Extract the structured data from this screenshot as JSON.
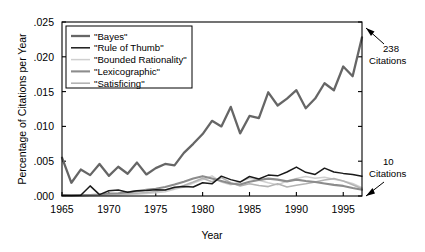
{
  "chart_data": {
    "type": "line",
    "title": "",
    "xlabel": "Year",
    "ylabel": "Percentage of Citations per Year",
    "xlim": [
      1965,
      1997
    ],
    "ylim": [
      0.0,
      0.025
    ],
    "grid": false,
    "legend_position": "top-left-inside",
    "xticks": [
      1965,
      1970,
      1975,
      1980,
      1985,
      1990,
      1995
    ],
    "xtick_labels": [
      "1965",
      "1970",
      "1975",
      "1980",
      "1985",
      "1990",
      "1995"
    ],
    "yticks": [
      0.0,
      0.005,
      0.01,
      0.015,
      0.02,
      0.025
    ],
    "ytick_labels": [
      ".000",
      ".005",
      ".010",
      ".015",
      ".020",
      ".025"
    ],
    "x": [
      1965,
      1966,
      1967,
      1968,
      1969,
      1970,
      1971,
      1972,
      1973,
      1974,
      1975,
      1976,
      1977,
      1978,
      1979,
      1980,
      1981,
      1982,
      1983,
      1984,
      1985,
      1986,
      1987,
      1988,
      1989,
      1990,
      1991,
      1992,
      1993,
      1994,
      1995,
      1996,
      1997
    ],
    "series": [
      {
        "name": "\"Bayes\"",
        "color": "#666666",
        "width": 2.3,
        "values": [
          0.0055,
          0.0019,
          0.0038,
          0.003,
          0.0046,
          0.0029,
          0.0042,
          0.0032,
          0.0048,
          0.0031,
          0.004,
          0.0046,
          0.0044,
          0.0062,
          0.0075,
          0.0089,
          0.0108,
          0.01,
          0.0128,
          0.009,
          0.0115,
          0.0112,
          0.0149,
          0.013,
          0.014,
          0.0152,
          0.0126,
          0.014,
          0.0162,
          0.0152,
          0.0186,
          0.0172,
          0.0228
        ]
      },
      {
        "name": "\"Rule of Thumb\"",
        "color": "#1a1a1a",
        "width": 1.5,
        "values": [
          0.0001,
          8e-05,
          0.00012,
          0.00145,
          0.0002,
          0.00075,
          0.00085,
          0.00055,
          0.00075,
          0.0008,
          0.0009,
          0.00085,
          0.00125,
          0.00135,
          0.0013,
          0.0019,
          0.00175,
          0.00285,
          0.00235,
          0.002,
          0.0028,
          0.00245,
          0.003,
          0.0029,
          0.00345,
          0.00415,
          0.0034,
          0.0031,
          0.004,
          0.00345,
          0.00325,
          0.0031,
          0.00285
        ]
      },
      {
        "name": "\"Bounded Rationality\"",
        "color": "#cfcfcf",
        "width": 1.5,
        "values": [
          5e-05,
          5e-05,
          5e-05,
          8e-05,
          0.0001,
          0.00015,
          0.00012,
          0.0002,
          0.00025,
          0.00035,
          0.00045,
          0.0006,
          0.00095,
          0.0013,
          0.00185,
          0.00235,
          0.0029,
          0.002,
          0.0016,
          0.00205,
          0.00255,
          0.00225,
          0.0019,
          0.0016,
          0.00215,
          0.0025,
          0.0028,
          0.00255,
          0.0027,
          0.0024,
          0.00215,
          0.0018,
          0.0012
        ]
      },
      {
        "name": "\"Lexicographic\"",
        "color": "#8c8c8c",
        "width": 2.1,
        "values": [
          8e-05,
          0.0001,
          0.00012,
          0.00015,
          0.00022,
          0.00035,
          0.0004,
          0.00055,
          0.0007,
          0.0009,
          0.00105,
          0.0013,
          0.00165,
          0.00205,
          0.0025,
          0.00285,
          0.0025,
          0.00215,
          0.0018,
          0.00165,
          0.00205,
          0.0023,
          0.0025,
          0.00235,
          0.0021,
          0.00235,
          0.00215,
          0.002,
          0.0018,
          0.0016,
          0.00145,
          0.00115,
          0.0009
        ]
      },
      {
        "name": "\"Satisficing\"",
        "color": "#b3b3b3",
        "width": 1.6,
        "values": [
          6e-05,
          6e-05,
          8e-05,
          0.0001,
          0.00014,
          0.00018,
          0.00025,
          0.0003,
          0.0004,
          0.0005,
          0.00065,
          0.00085,
          0.0011,
          0.0015,
          0.002,
          0.00255,
          0.00205,
          0.00265,
          0.0019,
          0.00145,
          0.00175,
          0.0015,
          0.00135,
          0.00175,
          0.0013,
          0.00155,
          0.00175,
          0.002,
          0.0023,
          0.0025,
          0.00215,
          0.0016,
          0.00105
        ]
      }
    ],
    "annotations": [
      {
        "id": "upper",
        "line1": "238",
        "line2": "Citations"
      },
      {
        "id": "lower",
        "line1": "10",
        "line2": "Citations"
      }
    ]
  }
}
